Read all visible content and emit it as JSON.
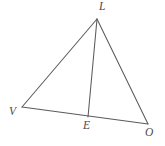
{
  "figure": {
    "background_color": "#ffffff",
    "line_color": "#5a5a5a",
    "label_color": "#4a4a4a",
    "width": 165,
    "height": 146,
    "vertices": [
      {
        "id": "L",
        "label": "L",
        "x": 97,
        "y": 19,
        "label_x": 99,
        "label_y": 1
      },
      {
        "id": "V",
        "label": "V",
        "x": 22,
        "y": 107,
        "label_x": 9,
        "label_y": 106
      },
      {
        "id": "E",
        "label": "E",
        "x": 88,
        "y": 117,
        "label_x": 83,
        "label_y": 120
      },
      {
        "id": "O",
        "label": "O",
        "x": 148,
        "y": 124,
        "label_x": 145,
        "label_y": 127
      }
    ],
    "segments": [
      {
        "id": "VL",
        "from": "V",
        "to": "L",
        "x1": 22,
        "y1": 107,
        "x2": 97,
        "y2": 19
      },
      {
        "id": "LO",
        "from": "L",
        "to": "O",
        "x1": 97,
        "y1": 19,
        "x2": 148,
        "y2": 124
      },
      {
        "id": "VO",
        "from": "V",
        "to": "O",
        "x1": 22,
        "y1": 107,
        "x2": 148,
        "y2": 124
      },
      {
        "id": "LE",
        "from": "L",
        "to": "E",
        "x1": 97,
        "y1": 19,
        "x2": 88,
        "y2": 117
      }
    ]
  }
}
